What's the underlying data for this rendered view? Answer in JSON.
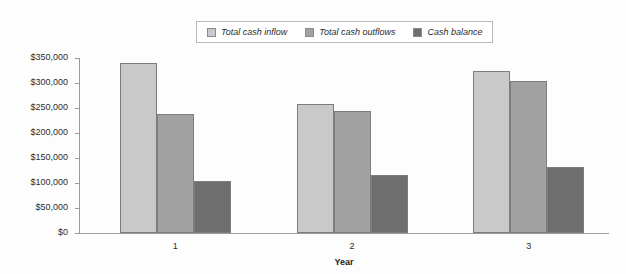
{
  "chart_data": {
    "type": "bar",
    "title": "",
    "xlabel": "Year",
    "ylabel": "",
    "categories": [
      "1",
      "2",
      "3"
    ],
    "series": [
      {
        "name": "Total cash inflow",
        "values": [
          340000,
          258000,
          324000
        ],
        "color": "#c9c9c9"
      },
      {
        "name": "Total cash outflows",
        "values": [
          238000,
          244000,
          305000
        ],
        "color": "#a2a2a2"
      },
      {
        "name": "Cash balance",
        "values": [
          104000,
          117000,
          133000
        ],
        "color": "#6e6e6e"
      }
    ],
    "ylim": [
      0,
      350000
    ],
    "ytick_values": [
      0,
      50000,
      100000,
      150000,
      200000,
      250000,
      300000,
      350000
    ],
    "ytick_labels": [
      "$0",
      "$50,000",
      "$100,000",
      "$150,000",
      "$200,000",
      "$250,000",
      "$300,000",
      "$350,000"
    ],
    "grid": false,
    "legend_position": "top-center",
    "legend_labels": [
      "Total cash inflow",
      "Total cash outflows",
      "Cash balance"
    ]
  }
}
